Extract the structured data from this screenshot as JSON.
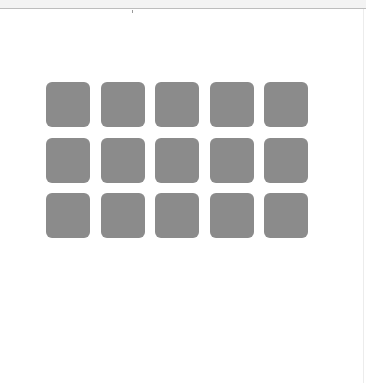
{
  "window": {
    "top_bar": "",
    "background": "#ffffff"
  },
  "grid": {
    "rows": 3,
    "columns": 5,
    "tile_color": "#8b8b8b",
    "tiles": [
      {
        "row": 1,
        "col": 1
      },
      {
        "row": 1,
        "col": 2
      },
      {
        "row": 1,
        "col": 3
      },
      {
        "row": 1,
        "col": 4
      },
      {
        "row": 1,
        "col": 5
      },
      {
        "row": 2,
        "col": 1
      },
      {
        "row": 2,
        "col": 2
      },
      {
        "row": 2,
        "col": 3
      },
      {
        "row": 2,
        "col": 4
      },
      {
        "row": 2,
        "col": 5
      },
      {
        "row": 3,
        "col": 1
      },
      {
        "row": 3,
        "col": 2
      },
      {
        "row": 3,
        "col": 3
      },
      {
        "row": 3,
        "col": 4
      },
      {
        "row": 3,
        "col": 5
      }
    ]
  }
}
